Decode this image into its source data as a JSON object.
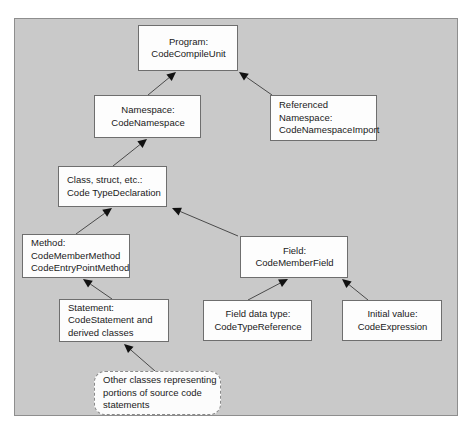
{
  "figure": {
    "panel_background": "#c9c9c9",
    "panel_border": "#8e8e8e",
    "node_fill": "#fdfdfd",
    "node_border": "#6e6e6e",
    "edge_color": "#4a4a4a",
    "text_color": "#1a1a1a"
  },
  "nodes": [
    {
      "id": "program",
      "lines": [
        "Program:",
        "CodeCompileUnit"
      ],
      "x": 138,
      "y": 25,
      "w": 100,
      "h": 46,
      "shape": "rect",
      "align": "center"
    },
    {
      "id": "namespace",
      "lines": [
        "Namespace:",
        "CodeNamespace"
      ],
      "x": 94,
      "y": 95,
      "w": 107,
      "h": 43,
      "shape": "rect",
      "align": "center"
    },
    {
      "id": "referenced-namespace",
      "lines": [
        "Referenced",
        "Namespace:",
        "CodeNamespaceImport"
      ],
      "x": 270,
      "y": 95,
      "w": 107,
      "h": 46,
      "shape": "rect",
      "align": "left"
    },
    {
      "id": "type-declaration",
      "lines": [
        "Class, struct, etc.:",
        "Code TypeDeclaration"
      ],
      "x": 58,
      "y": 166,
      "w": 109,
      "h": 41,
      "shape": "rect",
      "align": "left"
    },
    {
      "id": "method",
      "lines": [
        "Method:",
        "CodeMemberMethod",
        "CodeEntryPointMethod"
      ],
      "x": 22,
      "y": 234,
      "w": 108,
      "h": 44,
      "shape": "rect",
      "align": "left"
    },
    {
      "id": "field",
      "lines": [
        "Field:",
        "CodeMemberField"
      ],
      "x": 240,
      "y": 236,
      "w": 108,
      "h": 42,
      "shape": "rect",
      "align": "center"
    },
    {
      "id": "statement",
      "lines": [
        "Statement:",
        "CodeStatement and",
        "derived classes"
      ],
      "x": 59,
      "y": 299,
      "w": 110,
      "h": 43,
      "shape": "rect",
      "align": "left"
    },
    {
      "id": "field-data-type",
      "lines": [
        "Field data type:",
        "CodeTypeReference"
      ],
      "x": 203,
      "y": 300,
      "w": 109,
      "h": 41,
      "shape": "rect",
      "align": "center"
    },
    {
      "id": "initial-value",
      "lines": [
        "Initial value:",
        "CodeExpression"
      ],
      "x": 342,
      "y": 300,
      "w": 100,
      "h": 41,
      "shape": "rect",
      "align": "center"
    },
    {
      "id": "other-classes",
      "lines": [
        "Other classes representing",
        "portions of source code",
        "statements"
      ],
      "x": 94,
      "y": 371,
      "w": 127,
      "h": 44,
      "shape": "rounded",
      "align": "left"
    }
  ],
  "edges": [
    {
      "id": "namespace-to-program",
      "from": "namespace",
      "to": "program",
      "x1": 148,
      "y1": 95,
      "x2": 176,
      "y2": 72,
      "arrow_at": "end"
    },
    {
      "id": "referenced-namespace-to-program",
      "from": "referenced-namespace",
      "to": "program",
      "x1": 272,
      "y1": 95,
      "x2": 239,
      "y2": 72,
      "arrow_at": "end"
    },
    {
      "id": "type-declaration-to-namespace",
      "from": "type-declaration",
      "to": "namespace",
      "x1": 113,
      "y1": 166,
      "x2": 147,
      "y2": 139,
      "arrow_at": "end"
    },
    {
      "id": "method-to-type-declaration",
      "from": "method",
      "to": "type-declaration",
      "x1": 76,
      "y1": 234,
      "x2": 112,
      "y2": 208,
      "arrow_at": "end"
    },
    {
      "id": "field-to-type-declaration",
      "from": "field",
      "to": "type-declaration",
      "x1": 238,
      "y1": 236,
      "x2": 172,
      "y2": 208,
      "arrow_at": "end"
    },
    {
      "id": "statement-to-method",
      "from": "statement",
      "to": "method",
      "x1": 112,
      "y1": 299,
      "x2": 83,
      "y2": 279,
      "arrow_at": "end"
    },
    {
      "id": "field-data-type-to-field",
      "from": "field-data-type",
      "to": "field",
      "x1": 248,
      "y1": 300,
      "x2": 288,
      "y2": 279,
      "arrow_at": "end"
    },
    {
      "id": "initial-value-to-field",
      "from": "initial-value",
      "to": "field",
      "x1": 368,
      "y1": 300,
      "x2": 342,
      "y2": 279,
      "arrow_at": "end"
    },
    {
      "id": "other-classes-to-statement",
      "from": "other-classes",
      "to": "statement",
      "x1": 155,
      "y1": 371,
      "x2": 124,
      "y2": 344,
      "arrow_at": "end"
    }
  ]
}
